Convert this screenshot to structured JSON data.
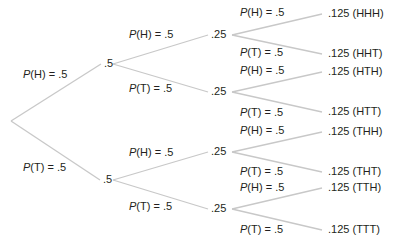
{
  "diagram": {
    "type": "probability-tree",
    "line_color": "#c8c8c8",
    "text_color": "#231f20",
    "root": {
      "x": 11,
      "y": 121
    },
    "level1": {
      "nodes": [
        {
          "id": "H",
          "value": ".5",
          "x": 104,
          "y": 63,
          "line_x": 113
        },
        {
          "id": "T",
          "value": ".5",
          "x": 103,
          "y": 179,
          "line_x": 113
        }
      ],
      "edge_labels": [
        {
          "prefix": "P",
          "text": "(H) = .5",
          "x": 23,
          "y": 74
        },
        {
          "prefix": "P",
          "text": "(T) = .5",
          "x": 23,
          "y": 167
        }
      ]
    },
    "level2": {
      "nodes": [
        {
          "id": "HH",
          "value": ".25",
          "x": 211,
          "y": 34,
          "parent": 0
        },
        {
          "id": "HT",
          "value": ".25",
          "x": 211,
          "y": 91,
          "parent": 0
        },
        {
          "id": "TH",
          "value": ".25",
          "x": 211,
          "y": 151,
          "parent": 1
        },
        {
          "id": "TT",
          "value": ".25",
          "x": 211,
          "y": 208,
          "parent": 1
        }
      ],
      "edge_labels": [
        {
          "prefix": "P",
          "text": "(H) = .5",
          "x": 129,
          "y": 34
        },
        {
          "prefix": "P",
          "text": "(T) = .5",
          "x": 129,
          "y": 88
        },
        {
          "prefix": "P",
          "text": "(H) = .5",
          "x": 129,
          "y": 152
        },
        {
          "prefix": "P",
          "text": "(T) = .5",
          "x": 129,
          "y": 206
        }
      ]
    },
    "leaves": [
      {
        "value": ".125 (HHH)",
        "x": 328,
        "y": 13,
        "parent": 0
      },
      {
        "value": ".125 (HHT)",
        "x": 328,
        "y": 53,
        "parent": 0
      },
      {
        "value": ".125 (HTH)",
        "x": 328,
        "y": 71,
        "parent": 1
      },
      {
        "value": ".125 (HTT)",
        "x": 328,
        "y": 111,
        "parent": 1
      },
      {
        "value": ".125 (THH)",
        "x": 328,
        "y": 131,
        "parent": 2
      },
      {
        "value": ".125 (THT)",
        "x": 328,
        "y": 171,
        "parent": 2
      },
      {
        "value": ".125 (TTH)",
        "x": 328,
        "y": 187,
        "parent": 3
      },
      {
        "value": ".125 (TTT)",
        "x": 328,
        "y": 229,
        "parent": 3
      }
    ],
    "leaf_edge_labels": [
      {
        "prefix": "P",
        "text": "(H) = .5",
        "x": 240,
        "y": 12
      },
      {
        "prefix": "P",
        "text": "(T) = .5",
        "x": 240,
        "y": 52
      },
      {
        "prefix": "P",
        "text": "(H) = .5",
        "x": 240,
        "y": 70
      },
      {
        "prefix": "P",
        "text": "(T) = .5",
        "x": 240,
        "y": 112
      },
      {
        "prefix": "P",
        "text": "(H) = .5",
        "x": 240,
        "y": 130
      },
      {
        "prefix": "P",
        "text": "(T) = .5",
        "x": 240,
        "y": 171
      },
      {
        "prefix": "P",
        "text": "(H) = .5",
        "x": 240,
        "y": 187
      },
      {
        "prefix": "P",
        "text": "(T) = .5",
        "x": 240,
        "y": 229
      }
    ]
  }
}
